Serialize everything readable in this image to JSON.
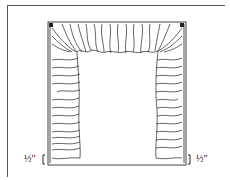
{
  "diagram": {
    "parts": [
      "valance",
      "left-panel",
      "right-panel",
      "window-frame"
    ],
    "labels": {
      "left_measure": "½\"",
      "right_measure": "½\""
    },
    "colors": {
      "line": "#222222",
      "frame": "#555555",
      "background": "#ffffff"
    }
  }
}
